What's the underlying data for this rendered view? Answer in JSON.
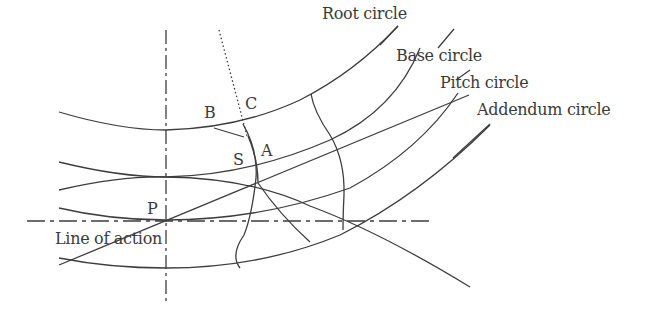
{
  "diagram": {
    "colors": {
      "stroke": "#3d3d3d",
      "text": "#3a3a3a",
      "background": "#ffffff"
    },
    "labels": {
      "root_circle": "Root circle",
      "base_circle": "Base circle",
      "pitch_circle": "Pitch circle",
      "addendum_circle": "Addendum circle",
      "line_of_action": "Line of action"
    },
    "points": {
      "B": "B",
      "C": "C",
      "S": "S",
      "A": "A",
      "P": "P"
    }
  }
}
